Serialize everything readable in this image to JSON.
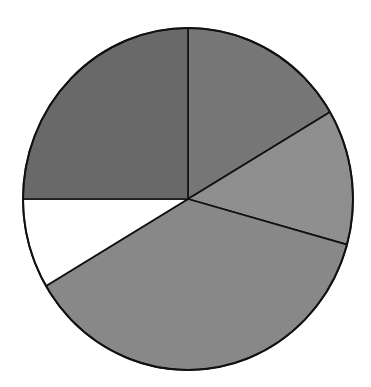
{
  "chart_data": {
    "type": "pie",
    "title": "",
    "legend": "none",
    "labels_visible": false,
    "start_angle_deg": 0,
    "direction": "clockwise",
    "center": [
      188,
      199
    ],
    "radius": [
      165,
      171
    ],
    "slices": [
      {
        "name": "slice-1",
        "value": 16.5,
        "color": "#7a7a7a"
      },
      {
        "name": "slice-2",
        "value": 12.8,
        "color": "#939393"
      },
      {
        "name": "slice-3",
        "value": 37.2,
        "color": "#8c8c8c"
      },
      {
        "name": "slice-4",
        "value": 8.5,
        "color": "#ffffff"
      },
      {
        "name": "slice-5",
        "value": 25.0,
        "color": "#6c6c6c"
      }
    ]
  }
}
